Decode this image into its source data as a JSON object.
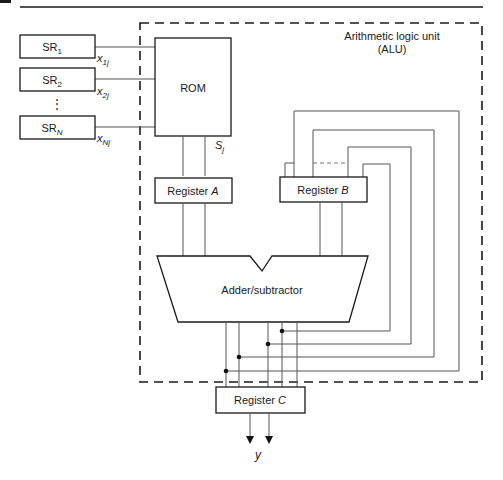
{
  "diagram": {
    "alu_label_line1": "Arithmetic logic unit",
    "alu_label_line2": "(ALU)",
    "shift_registers": [
      {
        "base": "SR",
        "sub": "1",
        "output_base": "x",
        "output_sub": "1j"
      },
      {
        "base": "SR",
        "sub": "2",
        "output_base": "x",
        "output_sub": "2j"
      },
      {
        "base": "SR",
        "sub": "N",
        "output_base": "x",
        "output_sub": "Nj"
      }
    ],
    "ellipsis": "⋮",
    "rom_label": "ROM",
    "rom_output_base": "S",
    "rom_output_sub": "j",
    "register_a": {
      "prefix": "Register ",
      "name": "A"
    },
    "register_b": {
      "prefix": "Register ",
      "name": "B"
    },
    "register_c": {
      "prefix": "Register ",
      "name": "C"
    },
    "adder_label": "Adder/subtractor",
    "output_label": "y"
  }
}
